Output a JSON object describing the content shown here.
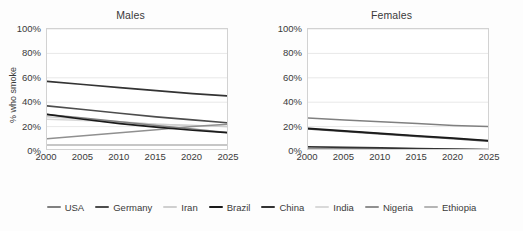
{
  "chart_data": {
    "type": "line",
    "title": "",
    "xlabel": "",
    "ylabel": "% who smoke",
    "x": [
      2000,
      2005,
      2010,
      2015,
      2020,
      2025
    ],
    "xlim": [
      2000,
      2025
    ],
    "ylim": [
      0,
      100
    ],
    "ytick_labels": [
      "0%",
      "20%",
      "40%",
      "60%",
      "80%",
      "100%"
    ],
    "ytick_values": [
      0,
      20,
      40,
      60,
      80,
      100
    ],
    "xtick_labels": [
      "2000",
      "2005",
      "2010",
      "2015",
      "2020",
      "2025"
    ],
    "grid": true,
    "legend_position": "bottom",
    "panels": [
      {
        "title": "Males",
        "series": [
          {
            "name": "USA",
            "color": "#808080",
            "width": 1.5,
            "values": [
              30,
              27,
              24,
              21,
              18,
              15
            ]
          },
          {
            "name": "Germany",
            "color": "#4d4d4d",
            "width": 1.6,
            "values": [
              37,
              34,
              31,
              28,
              25.5,
              23
            ]
          },
          {
            "name": "Iran",
            "color": "#cfcfcf",
            "width": 1.5,
            "values": [
              28,
              26,
              24,
              22,
              21,
              20
            ]
          },
          {
            "name": "Brazil",
            "color": "#1a1a1a",
            "width": 1.7,
            "values": [
              30,
              26,
              22.5,
              19.5,
              17,
              15
            ]
          },
          {
            "name": "China",
            "color": "#333333",
            "width": 1.7,
            "values": [
              57,
              54.5,
              52,
              49.5,
              47,
              45
            ]
          },
          {
            "name": "India",
            "color": "#d9d9d9",
            "width": 1.5,
            "values": [
              26,
              25,
              23.5,
              22,
              21,
              20
            ]
          },
          {
            "name": "Nigeria",
            "color": "#909090",
            "width": 1.5,
            "values": [
              10,
              12.5,
              15,
              17.5,
              20,
              22
            ]
          },
          {
            "name": "Ethiopia",
            "color": "#b5b5b5",
            "width": 1.5,
            "values": [
              5,
              5,
              5,
              5,
              5,
              5
            ]
          }
        ]
      },
      {
        "title": "Females",
        "series": [
          {
            "name": "USA",
            "color": "#808080",
            "width": 1.5,
            "values": [
              27,
              25.5,
              24,
              22.5,
              21,
              20
            ]
          },
          {
            "name": "Germany",
            "color": "#4d4d4d",
            "width": 1.6,
            "values": [
              18,
              16,
              14,
              12,
              10,
              8
            ]
          },
          {
            "name": "Iran",
            "color": "#cfcfcf",
            "width": 1.5,
            "values": [
              3,
              2.6,
              2.2,
              1.8,
              1.4,
              1
            ]
          },
          {
            "name": "Brazil",
            "color": "#1a1a1a",
            "width": 1.7,
            "values": [
              18.5,
              16.5,
              14.5,
              12.5,
              10.5,
              8.5
            ]
          },
          {
            "name": "China",
            "color": "#333333",
            "width": 1.7,
            "values": [
              3.5,
              3,
              2.5,
              2,
              1.6,
              1.2
            ]
          },
          {
            "name": "India",
            "color": "#d9d9d9",
            "width": 1.5,
            "values": [
              2.5,
              2.2,
              1.9,
              1.6,
              1.3,
              1
            ]
          },
          {
            "name": "Nigeria",
            "color": "#909090",
            "width": 1.5,
            "values": [
              2,
              1.8,
              1.6,
              1.4,
              1.2,
              1
            ]
          },
          {
            "name": "Ethiopia",
            "color": "#b5b5b5",
            "width": 1.5,
            "values": [
              1.5,
              1.4,
              1.3,
              1.2,
              1.1,
              1
            ]
          }
        ]
      }
    ],
    "legend": [
      {
        "label": "USA",
        "color": "#808080"
      },
      {
        "label": "Germany",
        "color": "#4d4d4d"
      },
      {
        "label": "Iran",
        "color": "#cfcfcf"
      },
      {
        "label": "Brazil",
        "color": "#1a1a1a"
      },
      {
        "label": "China",
        "color": "#333333"
      },
      {
        "label": "India",
        "color": "#d9d9d9"
      },
      {
        "label": "Nigeria",
        "color": "#909090"
      },
      {
        "label": "Ethiopia",
        "color": "#b5b5b5"
      }
    ]
  }
}
